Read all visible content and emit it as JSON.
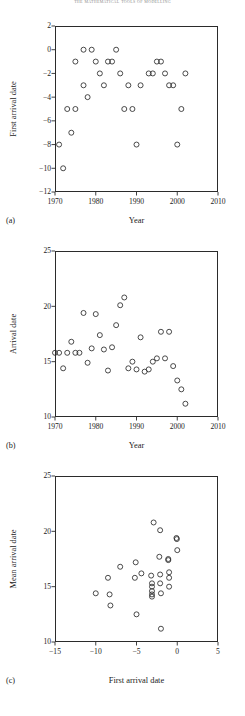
{
  "running_head": "the mathematical tools of modelling",
  "panels": [
    {
      "letter": "(a)",
      "xlabel": "Year",
      "ylabel": "First arrival date",
      "x_ticks": [
        "1970",
        "1980",
        "1990",
        "2000",
        "2010"
      ],
      "y_ticks": [
        "2",
        "0",
        "−2",
        "−4",
        "−6",
        "−8",
        "−10",
        "−12"
      ]
    },
    {
      "letter": "(b)",
      "xlabel": "Year",
      "ylabel": "Arrival date",
      "x_ticks": [
        "1970",
        "1980",
        "1990",
        "2000",
        "2010"
      ],
      "y_ticks": [
        "25",
        "20",
        "15",
        "10"
      ]
    },
    {
      "letter": "(c)",
      "xlabel": "First arrival date",
      "ylabel": "Mean arrival date",
      "x_ticks": [
        "−15",
        "−10",
        "−5",
        "0",
        "5"
      ],
      "y_ticks": [
        "25",
        "20",
        "15",
        "10"
      ]
    }
  ],
  "chart_data": [
    {
      "type": "scatter",
      "panel": "a",
      "title": "",
      "xlabel": "Year",
      "ylabel": "First arrival date",
      "xlim": [
        1970,
        2010
      ],
      "ylim": [
        -12,
        2
      ],
      "xticks": [
        1970,
        1980,
        1990,
        2000,
        2010
      ],
      "yticks": [
        2,
        0,
        -2,
        -4,
        -6,
        -8,
        -10,
        -12
      ],
      "grid": false,
      "legend": false,
      "marker": "open-circle",
      "points": [
        {
          "x": 1971,
          "y": -8
        },
        {
          "x": 1972,
          "y": -10
        },
        {
          "x": 1973,
          "y": -5
        },
        {
          "x": 1974,
          "y": -7
        },
        {
          "x": 1975,
          "y": -5
        },
        {
          "x": 1975,
          "y": -1
        },
        {
          "x": 1977,
          "y": 0
        },
        {
          "x": 1977,
          "y": -3
        },
        {
          "x": 1978,
          "y": -4
        },
        {
          "x": 1979,
          "y": 0
        },
        {
          "x": 1980,
          "y": -1
        },
        {
          "x": 1981,
          "y": -2
        },
        {
          "x": 1982,
          "y": -3
        },
        {
          "x": 1983,
          "y": -1
        },
        {
          "x": 1984,
          "y": -1
        },
        {
          "x": 1985,
          "y": 0
        },
        {
          "x": 1986,
          "y": -2
        },
        {
          "x": 1987,
          "y": -5
        },
        {
          "x": 1988,
          "y": -3
        },
        {
          "x": 1989,
          "y": -5
        },
        {
          "x": 1990,
          "y": -8
        },
        {
          "x": 1991,
          "y": -3
        },
        {
          "x": 1993,
          "y": -2
        },
        {
          "x": 1994,
          "y": -2
        },
        {
          "x": 1995,
          "y": -1
        },
        {
          "x": 1996,
          "y": -1
        },
        {
          "x": 1997,
          "y": -2
        },
        {
          "x": 1998,
          "y": -3
        },
        {
          "x": 1999,
          "y": -3
        },
        {
          "x": 2000,
          "y": -8
        },
        {
          "x": 2001,
          "y": -5
        },
        {
          "x": 2002,
          "y": -2
        }
      ]
    },
    {
      "type": "scatter",
      "panel": "b",
      "title": "",
      "xlabel": "Year",
      "ylabel": "Arrival date",
      "xlim": [
        1970,
        2010
      ],
      "ylim": [
        10,
        25
      ],
      "xticks": [
        1970,
        1980,
        1990,
        2000,
        2010
      ],
      "yticks": [
        25,
        20,
        15,
        10
      ],
      "grid": false,
      "legend": false,
      "marker": "open-circle",
      "points": [
        {
          "x": 1970,
          "y": 15.8
        },
        {
          "x": 1971,
          "y": 15.8
        },
        {
          "x": 1972,
          "y": 14.4
        },
        {
          "x": 1973,
          "y": 15.8
        },
        {
          "x": 1974,
          "y": 16.8
        },
        {
          "x": 1975,
          "y": 15.8
        },
        {
          "x": 1976,
          "y": 15.8
        },
        {
          "x": 1977,
          "y": 19.4
        },
        {
          "x": 1978,
          "y": 14.9
        },
        {
          "x": 1979,
          "y": 16.2
        },
        {
          "x": 1980,
          "y": 19.3
        },
        {
          "x": 1981,
          "y": 17.4
        },
        {
          "x": 1982,
          "y": 16.1
        },
        {
          "x": 1983,
          "y": 14.2
        },
        {
          "x": 1984,
          "y": 16.3
        },
        {
          "x": 1985,
          "y": 18.3
        },
        {
          "x": 1986,
          "y": 20.1
        },
        {
          "x": 1987,
          "y": 20.8
        },
        {
          "x": 1988,
          "y": 14.4
        },
        {
          "x": 1989,
          "y": 15.0
        },
        {
          "x": 1990,
          "y": 14.3
        },
        {
          "x": 1991,
          "y": 17.2
        },
        {
          "x": 1992,
          "y": 14.1
        },
        {
          "x": 1993,
          "y": 14.3
        },
        {
          "x": 1994,
          "y": 15.0
        },
        {
          "x": 1995,
          "y": 15.3
        },
        {
          "x": 1996,
          "y": 17.7
        },
        {
          "x": 1997,
          "y": 15.3
        },
        {
          "x": 1998,
          "y": 17.7
        },
        {
          "x": 1999,
          "y": 14.6
        },
        {
          "x": 2000,
          "y": 13.3
        },
        {
          "x": 2001,
          "y": 12.5
        },
        {
          "x": 2002,
          "y": 11.2
        }
      ]
    },
    {
      "type": "scatter",
      "panel": "c",
      "title": "",
      "xlabel": "First arrival date",
      "ylabel": "Mean arrival date",
      "xlim": [
        -15,
        5
      ],
      "ylim": [
        10,
        25
      ],
      "xticks": [
        -15,
        -10,
        -5,
        0,
        5
      ],
      "yticks": [
        25,
        20,
        15,
        10
      ],
      "grid": false,
      "legend": false,
      "marker": "open-circle",
      "points": [
        {
          "x": -10,
          "y": 14.4
        },
        {
          "x": -8.5,
          "y": 15.8
        },
        {
          "x": -8.3,
          "y": 14.3
        },
        {
          "x": -8.2,
          "y": 13.3
        },
        {
          "x": -7,
          "y": 16.8
        },
        {
          "x": -5.1,
          "y": 17.2
        },
        {
          "x": -5.2,
          "y": 15.8
        },
        {
          "x": -5,
          "y": 12.5
        },
        {
          "x": -4.4,
          "y": 16.2
        },
        {
          "x": -3.2,
          "y": 16.0
        },
        {
          "x": -3.1,
          "y": 15.3
        },
        {
          "x": -3.1,
          "y": 15.0
        },
        {
          "x": -3.1,
          "y": 14.6
        },
        {
          "x": -3.1,
          "y": 14.3
        },
        {
          "x": -3.1,
          "y": 14.1
        },
        {
          "x": -2.9,
          "y": 20.8
        },
        {
          "x": -2.1,
          "y": 20.1
        },
        {
          "x": -2.2,
          "y": 17.7
        },
        {
          "x": -2.1,
          "y": 16.1
        },
        {
          "x": -2.1,
          "y": 15.3
        },
        {
          "x": -2.0,
          "y": 14.4
        },
        {
          "x": -2.0,
          "y": 11.2
        },
        {
          "x": -1.1,
          "y": 17.5
        },
        {
          "x": -1.1,
          "y": 17.4
        },
        {
          "x": -1.0,
          "y": 16.3
        },
        {
          "x": -1.0,
          "y": 15.8
        },
        {
          "x": -1.0,
          "y": 15.0
        },
        {
          "x": -0.1,
          "y": 19.4
        },
        {
          "x": -0.05,
          "y": 19.3
        },
        {
          "x": 0.0,
          "y": 18.3
        }
      ]
    }
  ]
}
